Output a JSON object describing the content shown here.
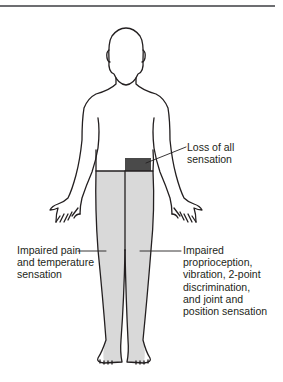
{
  "figure": {
    "colors": {
      "outline": "#231f20",
      "impaired_fill": "#d9d9d9",
      "loss_fill": "#4a4a4a",
      "rule": "#6d6e71"
    }
  },
  "labels": {
    "loss": "Loss of all\nsensation",
    "pain_temp": "Impaired pain\nand temperature\nsensation",
    "proprioception": "Impaired\nproprioception,\nvibration, 2-point\ndiscrimination,\nand joint and\nposition sensation"
  }
}
